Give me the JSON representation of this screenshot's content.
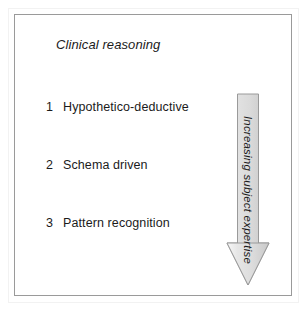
{
  "figure": {
    "title": "Clinical reasoning",
    "steps": [
      {
        "number": "1",
        "label": "Hypothetico-deductive"
      },
      {
        "number": "2",
        "label": "Schema driven"
      },
      {
        "number": "3",
        "label": "Pattern recognition"
      }
    ],
    "arrow": {
      "label": "Increasing subject expertise",
      "direction": "down",
      "fill_light": "#f4f4f4",
      "fill_mid": "#dcdcdc",
      "fill_dark": "#c2c2c2",
      "stroke": "#9a9a9a"
    },
    "border_color": "#9a9a9a",
    "text_color": "#1b1b1b",
    "background_color": "#ffffff"
  }
}
